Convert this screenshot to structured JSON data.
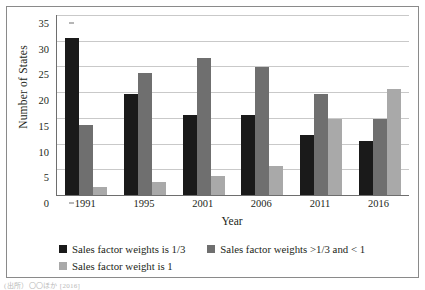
{
  "chart_data": {
    "type": "bar",
    "title": "",
    "xlabel": "Year",
    "ylabel": "Number of States",
    "categories": [
      "1991",
      "1995",
      "2001",
      "2006",
      "2011",
      "2016"
    ],
    "ylim": [
      0,
      35
    ],
    "yticks": [
      0,
      5,
      10,
      15,
      20,
      25,
      30,
      35
    ],
    "ytick_labels": [
      "0",
      "5",
      "10",
      "15",
      "20",
      "25",
      "30",
      "35"
    ],
    "grid": true,
    "legend_position": "bottom-left",
    "series": [
      {
        "name": "Sales factor weights is 1/3",
        "color": "#1a1a1a",
        "values": [
          30.6,
          19.7,
          15.6,
          15.6,
          11.7,
          10.6
        ]
      },
      {
        "name": "Sales factor weights >1/3 and < 1",
        "color": "#6f6f6f",
        "values": [
          13.7,
          23.7,
          26.7,
          24.8,
          19.7,
          14.7
        ]
      },
      {
        "name": "Sales factor weight is 1",
        "color": "#a9a9a9",
        "values": [
          1.6,
          2.6,
          3.7,
          5.6,
          14.7,
          20.7
        ]
      }
    ]
  },
  "legend": {
    "entries": [
      {
        "label": "Sales factor weights is 1/3"
      },
      {
        "label": "Sales factor weights >1/3 and < 1"
      },
      {
        "label": "Sales factor weight is 1"
      }
    ]
  },
  "caption": {
    "text": "(出所）〇〇ほか [2016]"
  }
}
